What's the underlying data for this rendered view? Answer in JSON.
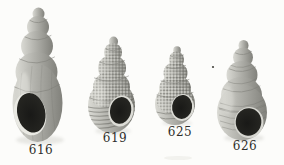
{
  "plate": {
    "background_color": "#fcfcfa",
    "shell_color_light": "#dadad4",
    "shell_color_mid": "#b1b1ab",
    "shell_color_dark": "#81817b",
    "aperture_color": "#191917",
    "label_color": "#2e2e2a",
    "specimens": [
      {
        "label": "616"
      },
      {
        "label": "619"
      },
      {
        "label": "625"
      },
      {
        "label": "626"
      }
    ]
  }
}
